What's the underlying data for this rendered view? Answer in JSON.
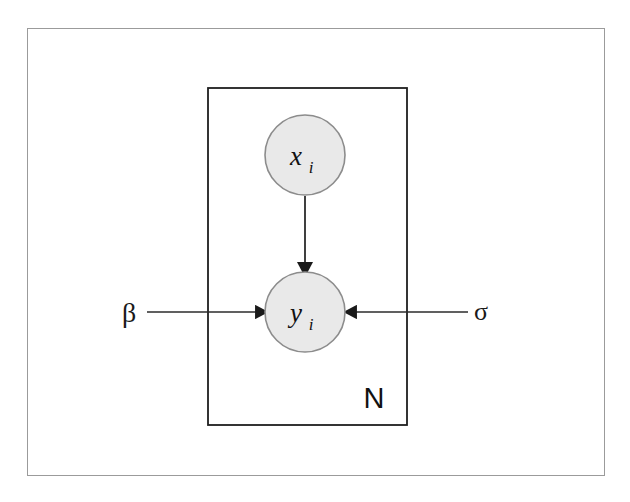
{
  "figure": {
    "type": "plate-notation-graphical-model",
    "caption": "",
    "background_color": "#ffffff",
    "frame_color": "#9b9b9b"
  },
  "style": {
    "node_fill": "#e9e9e9",
    "node_stroke": "#8c8c8c",
    "edge_color": "#2b2b2b",
    "plate_stroke": "#1f1f1f",
    "text_color": "#111111"
  },
  "nodes": [
    {
      "id": "x",
      "label": "x",
      "subscript": "i",
      "shape": "circle",
      "observed": true,
      "cx": 305,
      "cy": 155,
      "r": 40
    },
    {
      "id": "y",
      "label": "y",
      "subscript": "i",
      "shape": "circle",
      "observed": true,
      "cx": 305,
      "cy": 312,
      "r": 40
    }
  ],
  "parameters": [
    {
      "id": "beta",
      "label": "β",
      "name": "beta",
      "x": 129,
      "y": 312
    },
    {
      "id": "sigma",
      "label": "σ",
      "name": "sigma",
      "x": 481,
      "y": 312
    }
  ],
  "edges": [
    {
      "from": "x",
      "to": "y",
      "direction": "down"
    },
    {
      "from": "beta",
      "to": "y",
      "direction": "right"
    },
    {
      "from": "sigma",
      "to": "y",
      "direction": "left"
    }
  ],
  "plate": {
    "label": "N",
    "x": 208,
    "y": 88,
    "width": 199,
    "height": 337,
    "label_x": 374,
    "label_y": 404
  }
}
